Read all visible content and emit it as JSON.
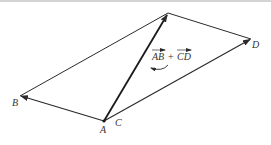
{
  "diagram": {
    "type": "vector-addition-parallelogram",
    "points": {
      "A": {
        "label": "A",
        "x": 104,
        "y": 121
      },
      "B": {
        "label": "B",
        "x": 20,
        "y": 96
      },
      "C": {
        "label": "C",
        "x": 104,
        "y": 121
      },
      "D": {
        "label": "D",
        "x": 251,
        "y": 39
      },
      "S": {
        "label": "",
        "x": 168,
        "y": 13
      }
    },
    "labels": {
      "A": "A",
      "B": "B",
      "C": "C",
      "D": "D",
      "sum_part1": "AB",
      "plus": "+",
      "sum_part2": "CD"
    },
    "vectors": [
      {
        "name": "AB",
        "from": "A",
        "to": "B",
        "arrow": true
      },
      {
        "name": "CD",
        "from": "C",
        "to": "D",
        "arrow": true
      },
      {
        "name": "AB+CD",
        "from": "A",
        "to": "S",
        "arrow": true,
        "bold": true
      }
    ],
    "edges": [
      {
        "from": "B",
        "to": "S"
      },
      {
        "from": "S",
        "to": "D"
      }
    ],
    "annotation": "AB + CD",
    "colors": {
      "line": "#2b2b2b",
      "text": "#333333"
    }
  }
}
